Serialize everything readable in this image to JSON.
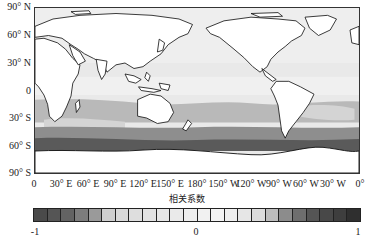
{
  "map": {
    "projection": "equirectangular, 0° to 360° longitude, centered on Pacific",
    "y_labels": [
      "90° N",
      "60° N",
      "30° N",
      "0",
      "30° S",
      "60° S",
      "90° S"
    ],
    "x_labels": [
      "0",
      "30° E",
      "60° E",
      "90° E",
      "120° E",
      "150° E",
      "180°",
      "150° W",
      "120° W",
      "90° W",
      "60° W",
      "30° W",
      "0°"
    ],
    "land_color": "#ffffff",
    "coastline_color": "#111111",
    "field_description": "Correlation coefficient field over oceans; near-zero (light gray) in tropics/north, moderate (mid gray) band 20°S–50°S, strong (dark gray) band near 60°S–70°S around Antarctica"
  },
  "colorbar": {
    "title": "相关系数",
    "min_label": "-1",
    "mid_label": "0",
    "max_label": "1",
    "segments": [
      "#4a4a4a",
      "#555555",
      "#636363",
      "#7d7d7d",
      "#9a9a9a",
      "#cfcfcf",
      "#d9d9d9",
      "#dedede",
      "#e2e2e2",
      "#e6e6e6",
      "#eaeaea",
      "#eeeeee",
      "#f1f1f1",
      "#f3f3f3",
      "#eeeeee",
      "#e6e6e6",
      "#dcdcdc",
      "#bdbdbd",
      "#8c8c8c",
      "#6e6e6e",
      "#555555",
      "#484848",
      "#3e3e3e",
      "#2f2f2f"
    ]
  }
}
